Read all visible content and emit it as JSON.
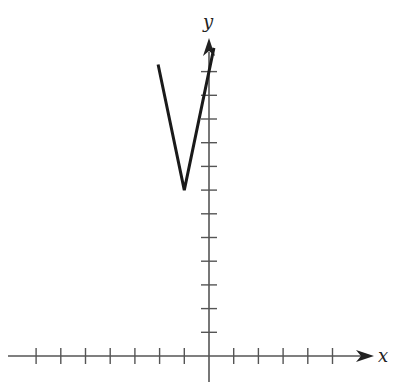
{
  "chart_data": {
    "type": "line",
    "title": "",
    "xlabel": "x",
    "ylabel": "y",
    "function": "y = 5|x + 1| + 7",
    "x": [
      -2.06,
      -1,
      0.2
    ],
    "y": [
      12.3,
      7,
      13
    ],
    "vertex": {
      "x": -1,
      "y": 7
    },
    "x_ticks_left": 7,
    "x_ticks_right": 5,
    "y_ticks": 12,
    "tick_labels_shown": false,
    "xlim": [
      -8.5,
      6.7
    ],
    "ylim": [
      -1,
      15
    ],
    "grid": false,
    "legend": "none"
  },
  "style": {
    "axis_color": "#555555",
    "curve_color": "#1a1a1a",
    "background": "#ffffff"
  },
  "labels": {
    "x_axis": "x",
    "y_axis": "y"
  }
}
